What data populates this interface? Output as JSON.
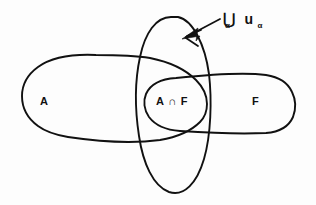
{
  "figure": {
    "background_color": "#fdfdfd",
    "ink_color": "#111111",
    "width": 316,
    "height": 205
  },
  "labels": {
    "set_a": "A",
    "set_f": "F",
    "intersection": "A ∩ F",
    "union_operator": "⋃",
    "union_operator_subscript": "α",
    "union_operand": "u",
    "union_operand_subscript": "α",
    "union_full": "⋃α uα"
  },
  "annotation": {
    "arrow_name": "pointer-to-union-oval",
    "arrow_points_to": "union oval boundary"
  },
  "regions": [
    {
      "name": "set-a-blob",
      "label": "A",
      "shape": "horizontal rounded blob, left"
    },
    {
      "name": "set-f-blob",
      "label": "F",
      "shape": "horizontal rounded blob, right"
    },
    {
      "name": "intersection-lens",
      "label": "A ∩ F",
      "shape": "lens overlap of A and F"
    },
    {
      "name": "union-oval",
      "label": "⋃α uα",
      "shape": "tall vertical ellipse"
    }
  ]
}
